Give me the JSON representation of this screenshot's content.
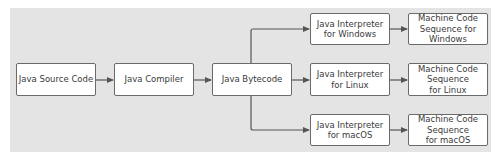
{
  "diagram": {
    "type": "flowchart",
    "title": "",
    "nodes": {
      "source": {
        "label": "Java Source Code"
      },
      "compiler": {
        "label": "Java Compiler"
      },
      "bytecode": {
        "label": "Java Bytecode"
      },
      "interp_windows": {
        "label": "Java Interpreter\nfor Windows"
      },
      "interp_linux": {
        "label": "Java Interpreter\nfor Linux"
      },
      "interp_macos": {
        "label": "Java Interpreter\nfor macOS"
      },
      "mc_windows": {
        "label": "Machine Code\nSequence for\nWindows"
      },
      "mc_linux": {
        "label": "Machine Code\nSequence\nfor Linux"
      },
      "mc_macos": {
        "label": "Machine Code\nSequence\nfor macOS"
      }
    },
    "edges": [
      [
        "source",
        "compiler"
      ],
      [
        "compiler",
        "bytecode"
      ],
      [
        "bytecode",
        "interp_windows"
      ],
      [
        "bytecode",
        "interp_linux"
      ],
      [
        "bytecode",
        "interp_macos"
      ],
      [
        "interp_windows",
        "mc_windows"
      ],
      [
        "interp_linux",
        "mc_linux"
      ],
      [
        "interp_macos",
        "mc_macos"
      ]
    ],
    "colors": {
      "panel": "#e4e4e4",
      "box_fill": "#ffffff",
      "box_border": "#6a6a6a",
      "arrow": "#555555",
      "text": "#3a3a3a"
    }
  }
}
